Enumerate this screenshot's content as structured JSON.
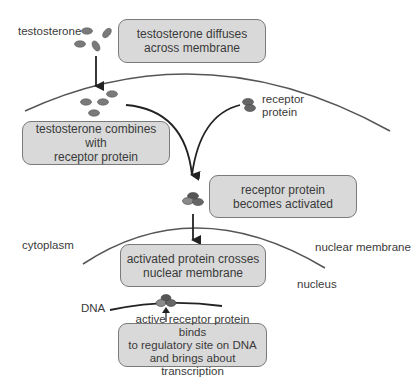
{
  "diagram": {
    "colors": {
      "box_fill": "#d9d9d9",
      "box_border": "#7a7a7a",
      "membrane": "#555555",
      "arrow": "#222222",
      "molecule": "#777777",
      "text": "#3a3a3a"
    },
    "steps": [
      {
        "id": "step-1",
        "lines": [
          "testosterone diffuses",
          "across membrane"
        ]
      },
      {
        "id": "step-2",
        "lines": [
          "testosterone combines with",
          "receptor protein"
        ]
      },
      {
        "id": "step-3",
        "lines": [
          "receptor protein",
          "becomes activated"
        ]
      },
      {
        "id": "step-4",
        "lines": [
          "activated protein crosses",
          "nuclear membrane"
        ]
      },
      {
        "id": "step-5",
        "lines": [
          "active receptor protein binds",
          "to regulatory site on DNA",
          "and brings about transcription"
        ]
      }
    ],
    "labels": {
      "testosterone": "testosterone",
      "receptor_protein": [
        "receptor",
        "protein"
      ],
      "cytoplasm": "cytoplasm",
      "nuclear_membrane": "nuclear membrane",
      "nucleus": "nucleus",
      "dna": "DNA"
    },
    "nodes": [
      {
        "name": "testosterone",
        "type": "molecule-group"
      },
      {
        "name": "cell-membrane",
        "type": "membrane"
      },
      {
        "name": "receptor-protein",
        "type": "molecule"
      },
      {
        "name": "activated-complex",
        "type": "molecule"
      },
      {
        "name": "nuclear-membrane",
        "type": "membrane"
      },
      {
        "name": "dna",
        "type": "strand"
      }
    ],
    "edges": [
      {
        "from": "testosterone",
        "to": "cell-membrane",
        "type": "arrow"
      },
      {
        "from": "testosterone",
        "to": "activated-complex",
        "type": "curved-arrow"
      },
      {
        "from": "receptor-protein",
        "to": "activated-complex",
        "type": "curved-arrow"
      },
      {
        "from": "activated-complex",
        "to": "nuclear-membrane",
        "type": "arrow"
      },
      {
        "from": "step-5",
        "to": "dna",
        "type": "arrow"
      }
    ]
  }
}
